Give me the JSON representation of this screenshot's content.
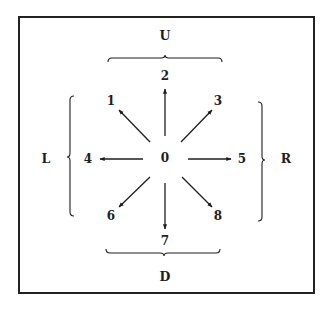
{
  "diagram": {
    "center_label": "0",
    "direction_labels": {
      "up": "U",
      "down": "D",
      "left": "L",
      "right": "R"
    },
    "nodes": [
      {
        "id": "1",
        "label": "1",
        "direction": "up-left"
      },
      {
        "id": "2",
        "label": "2",
        "direction": "up"
      },
      {
        "id": "3",
        "label": "3",
        "direction": "up-right"
      },
      {
        "id": "4",
        "label": "4",
        "direction": "left"
      },
      {
        "id": "5",
        "label": "5",
        "direction": "right"
      },
      {
        "id": "6",
        "label": "6",
        "direction": "down-left"
      },
      {
        "id": "7",
        "label": "7",
        "direction": "down"
      },
      {
        "id": "8",
        "label": "8",
        "direction": "down-right"
      }
    ],
    "groups": [
      {
        "label": "U",
        "members": [
          "1",
          "2",
          "3"
        ],
        "bracket": "top"
      },
      {
        "label": "L",
        "members": [
          "1",
          "4",
          "6"
        ],
        "bracket": "left"
      },
      {
        "label": "R",
        "members": [
          "3",
          "5",
          "8"
        ],
        "bracket": "right"
      },
      {
        "label": "D",
        "members": [
          "6",
          "7",
          "8"
        ],
        "bracket": "bottom"
      }
    ],
    "colors": {
      "ink": "#1e1e1e",
      "background": "#ffffff"
    }
  }
}
